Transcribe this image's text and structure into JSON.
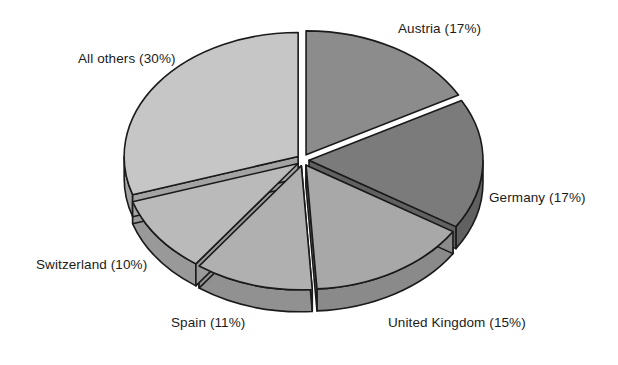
{
  "chart_data": {
    "type": "pie",
    "title": "",
    "subtitle": "",
    "xlabel": "",
    "ylabel": "",
    "legend_position": "none",
    "grid": false,
    "style": "3d-exploded-grayscale",
    "start_angle_deg": 0,
    "direction": "clockwise",
    "units": "percent",
    "total": 100,
    "categories": [
      "Austria",
      "Germany",
      "United Kingdom",
      "Spain",
      "Switzerland",
      "All others"
    ],
    "values": [
      17,
      17,
      15,
      11,
      10,
      30
    ],
    "labels": [
      "Austria (17%)",
      "Germany (17%)",
      "United Kingdom (15%)",
      "Spain (11%)",
      "Switzerland (10%)",
      "All others (30%)"
    ],
    "colors": [
      "#8c8c8c",
      "#7b7b7b",
      "#a8a8a8",
      "#b0b0b0",
      "#bababa",
      "#c6c6c6"
    ],
    "side_colors": [
      "#6e6e6e",
      "#616161",
      "#8a8a8a",
      "#919191",
      "#999999",
      "#a3a3a3"
    ],
    "slices": [
      {
        "name": "Austria",
        "value": 17,
        "label": "Austria (17%)",
        "color": "#8c8c8c"
      },
      {
        "name": "Germany",
        "value": 17,
        "label": "Germany (17%)",
        "color": "#7b7b7b"
      },
      {
        "name": "United Kingdom",
        "value": 15,
        "label": "United Kingdom (15%)",
        "color": "#a8a8a8"
      },
      {
        "name": "Spain",
        "value": 11,
        "label": "Spain (11%)",
        "color": "#b0b0b0"
      },
      {
        "name": "Switzerland",
        "value": 10,
        "label": "Switzerland (10%)",
        "color": "#bababa"
      },
      {
        "name": "All others",
        "value": 30,
        "label": "All others (30%)",
        "color": "#c6c6c6"
      }
    ],
    "outline_color": "#1a1a1a"
  },
  "labels": {
    "austria": "Austria (17%)",
    "germany": "Germany (17%)",
    "united_kingdom": "United Kingdom (15%)",
    "spain": "Spain (11%)",
    "switzerland": "Switzerland (10%)",
    "all_others": "All others (30%)"
  }
}
